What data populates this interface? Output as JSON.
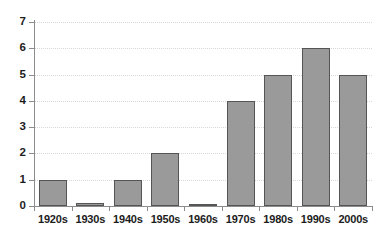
{
  "chart_data": {
    "type": "bar",
    "title": "",
    "subtitle": "",
    "xlabel": "",
    "ylabel": "",
    "categories": [
      "1920s",
      "1930s",
      "1940s",
      "1950s",
      "1960s",
      "1970s",
      "1980s",
      "1990s",
      "2000s"
    ],
    "values": [
      1,
      0.1,
      1,
      2,
      0.05,
      4,
      5,
      6,
      5
    ],
    "ylim": [
      0,
      7
    ],
    "yticks": [
      0,
      1,
      2,
      3,
      4,
      5,
      6,
      7
    ],
    "ytick_labels": [
      "0",
      "1",
      "2",
      "3",
      "4",
      "5",
      "6",
      "7"
    ],
    "grid": true,
    "grid_axis": "y",
    "grid_style": "dotted",
    "legend": false,
    "legend_position": "none",
    "bar_color": "#9a9a9a",
    "bar_edge_color": "#555555",
    "grid_color": "#d8d8d8",
    "axis_color": "#8c8c8c",
    "text_color": "#1c1c1c",
    "background_color": "#ffffff"
  }
}
